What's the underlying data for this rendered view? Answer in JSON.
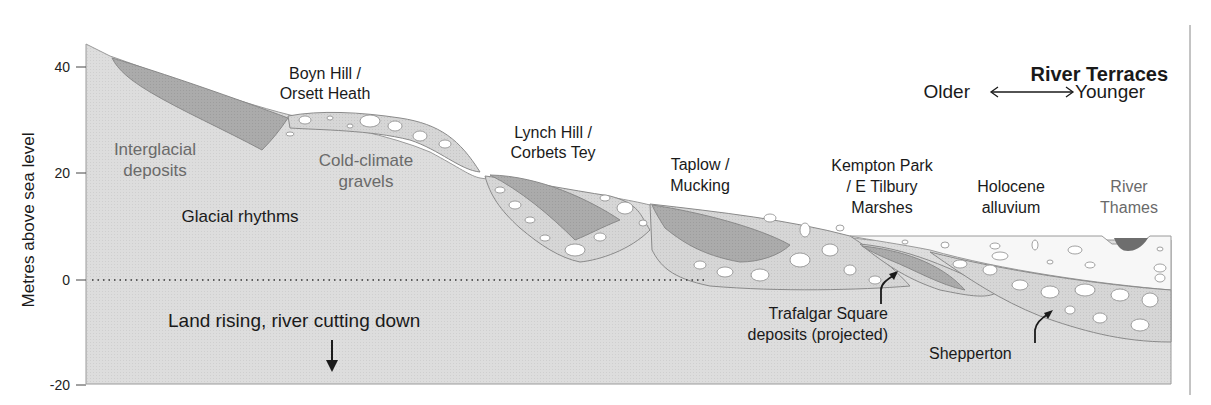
{
  "title": "River Terraces",
  "age_axis": {
    "left": "Older",
    "right": "Younger",
    "arrow": "double-arrow-icon"
  },
  "y_axis": {
    "label": "Metres above sea level",
    "ticks": [
      "40",
      "20",
      "0",
      "-20"
    ]
  },
  "sea_level_line": "dotted line at 0 m",
  "terraces": [
    {
      "id": "boyn-hill",
      "line1": "Boyn Hill /",
      "line2": "Orsett Heath"
    },
    {
      "id": "lynch-hill",
      "line1": "Lynch Hill /",
      "line2": "Corbets Tey"
    },
    {
      "id": "taplow",
      "line1": "Taplow /",
      "line2": "Mucking"
    },
    {
      "id": "kempton-park",
      "line1": "Kempton Park",
      "line2": "/ E Tilbury",
      "line3": "Marshes"
    },
    {
      "id": "holocene",
      "line1": "Holocene",
      "line2": "alluvium"
    },
    {
      "id": "river-thames",
      "line1": "River",
      "line2": "Thames"
    }
  ],
  "deposit_labels": {
    "interglacial": {
      "line1": "Interglacial",
      "line2": "deposits"
    },
    "cold_climate": {
      "line1": "Cold-climate",
      "line2": "gravels"
    },
    "glacial": "Glacial rhythms"
  },
  "annotations": {
    "land_rising": "Land rising, river cutting down",
    "trafalgar": {
      "line1": "Trafalgar Square",
      "line2": "deposits (projected)"
    },
    "shepperton": "Shepperton"
  },
  "colors": {
    "bedrock": "#dcdcdc",
    "interglacial": "#a9a9a9",
    "gravel": "#d4d4d4",
    "alluvium": "#f7f7f7",
    "river": "#6e6e6e",
    "outline": "#8a8a8a",
    "text": "#1a1a1a",
    "grey_text": "#6a6a6a"
  }
}
